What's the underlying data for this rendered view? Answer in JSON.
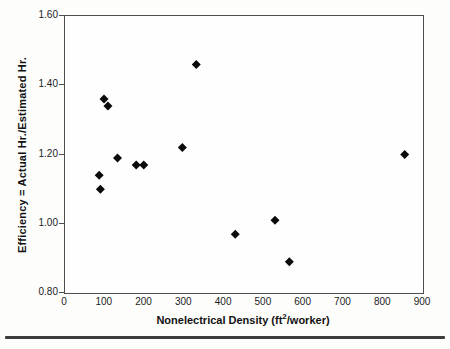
{
  "page": {
    "background": "#fdfdfc",
    "frame_color": "#4e4e4e",
    "text_color": "#1c1c1c",
    "rule_color": "#3c3c3c"
  },
  "chart_data": {
    "type": "scatter",
    "title": "",
    "xlabel": "Nonelectrical Density (ft2/worker)",
    "xlabel_parts": {
      "pre": "Nonelectrical Density (ft",
      "sup": "2",
      "post": "/worker)"
    },
    "ylabel": "Efficiency = Actual Hr./Estimated Hr.",
    "xlim": [
      0,
      900
    ],
    "ylim": [
      0.8,
      1.6
    ],
    "x_ticks": [
      0,
      100,
      200,
      300,
      400,
      500,
      600,
      700,
      800,
      900
    ],
    "y_ticks": [
      {
        "value": 0.8,
        "label": "0.80"
      },
      {
        "value": 1.0,
        "label": "1.00"
      },
      {
        "value": 1.2,
        "label": "1.20"
      },
      {
        "value": 1.4,
        "label": "1.40"
      },
      {
        "value": 1.6,
        "label": "1.60"
      }
    ],
    "grid": false,
    "legend": "none",
    "marker": {
      "shape": "diamond",
      "color": "#0b0b0b",
      "size": 9
    },
    "points": [
      {
        "x": 86,
        "y": 1.14
      },
      {
        "x": 89,
        "y": 1.1
      },
      {
        "x": 98,
        "y": 1.36
      },
      {
        "x": 108,
        "y": 1.34
      },
      {
        "x": 132,
        "y": 1.19
      },
      {
        "x": 179,
        "y": 1.17
      },
      {
        "x": 198,
        "y": 1.17
      },
      {
        "x": 295,
        "y": 1.22
      },
      {
        "x": 330,
        "y": 1.46
      },
      {
        "x": 428,
        "y": 0.97
      },
      {
        "x": 528,
        "y": 1.01
      },
      {
        "x": 564,
        "y": 0.89
      },
      {
        "x": 854,
        "y": 1.2
      }
    ]
  }
}
